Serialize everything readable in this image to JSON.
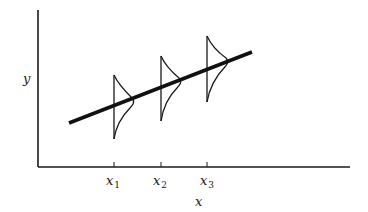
{
  "diagram": {
    "title": "",
    "axes": {
      "y_label": "y",
      "x_label": "x"
    },
    "ticks": [
      {
        "base": "x",
        "sub": "1"
      },
      {
        "base": "x",
        "sub": "2"
      },
      {
        "base": "x",
        "sub": "3"
      }
    ],
    "colors": {
      "ink": "#1a1a1a",
      "background": "#ffffff"
    }
  }
}
